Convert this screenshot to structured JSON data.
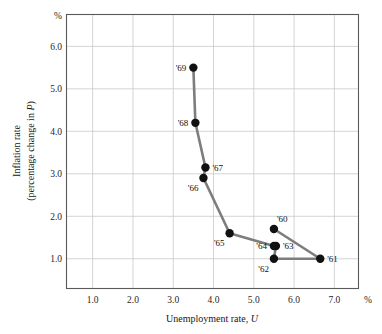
{
  "chart_data": {
    "type": "line",
    "title": "",
    "subtitle": "",
    "xlabel": "Unemployment rate, U",
    "ylabel": "Inflation rate (percentage change in P)",
    "ylabel_line1": "Inflation rate",
    "ylabel_line2": "(percentage change in P)",
    "x_unit": "%",
    "y_unit": "%",
    "xlim": [
      0.35,
      7.6
    ],
    "ylim": [
      0.3,
      6.75
    ],
    "xticks": [
      "1.0",
      "2.0",
      "3.0",
      "4.0",
      "5.0",
      "6.0",
      "7.0"
    ],
    "xtick_values": [
      1.0,
      2.0,
      3.0,
      4.0,
      5.0,
      6.0,
      7.0
    ],
    "yticks": [
      "1.0",
      "2.0",
      "3.0",
      "4.0",
      "5.0",
      "6.0"
    ],
    "ytick_values": [
      1.0,
      2.0,
      3.0,
      4.0,
      5.0,
      6.0
    ],
    "grid": true,
    "legend": "none",
    "series": [
      {
        "name": "Phillips curve path 1960-1969",
        "line_color": "#7d7d7d",
        "marker_color": "#111111",
        "points": [
          {
            "label": "'60",
            "x": 5.5,
            "y": 1.7,
            "label_pos": "above-right"
          },
          {
            "label": "'61",
            "x": 6.65,
            "y": 1.0,
            "label_pos": "right"
          },
          {
            "label": "'62",
            "x": 5.5,
            "y": 1.0,
            "label_pos": "below-left"
          },
          {
            "label": "'63",
            "x": 5.55,
            "y": 1.3,
            "label_pos": "right"
          },
          {
            "label": "'64",
            "x": 5.5,
            "y": 1.3,
            "label_pos": "left"
          },
          {
            "label": "'65",
            "x": 4.4,
            "y": 1.6,
            "label_pos": "below-left"
          },
          {
            "label": "'66",
            "x": 3.75,
            "y": 2.9,
            "label_pos": "below-left"
          },
          {
            "label": "'67",
            "x": 3.8,
            "y": 3.15,
            "label_pos": "right"
          },
          {
            "label": "'68",
            "x": 3.55,
            "y": 4.2,
            "label_pos": "left"
          },
          {
            "label": "'69",
            "x": 3.5,
            "y": 5.5,
            "label_pos": "left"
          }
        ]
      }
    ]
  }
}
